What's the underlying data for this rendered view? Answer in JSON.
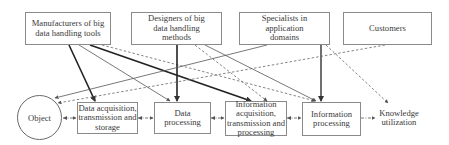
{
  "diagram": {
    "top_nodes": [
      {
        "id": "manufacturers",
        "label": "Manufacturers of big data handling tools"
      },
      {
        "id": "designers",
        "label": "Designers of big data handling methods"
      },
      {
        "id": "specialists",
        "label": "Specialists in application domains"
      },
      {
        "id": "customers",
        "label": "Customers"
      }
    ],
    "flow_nodes": [
      {
        "id": "object",
        "label": "Object",
        "shape": "circle"
      },
      {
        "id": "data_acquisition",
        "label": "Data acquisition, transmission and storage"
      },
      {
        "id": "data_processing",
        "label": "Data processing"
      },
      {
        "id": "info_acquisition",
        "label": "Information acquisition, transmission and processing"
      },
      {
        "id": "info_processing",
        "label": "Information processing"
      },
      {
        "id": "knowledge",
        "label": "Knowledge utilization",
        "shape": "none"
      }
    ],
    "edges": [
      {
        "from": "manufacturers",
        "to": "data_acquisition",
        "style": "thick-solid"
      },
      {
        "from": "manufacturers",
        "to": "data_processing",
        "style": "thin-solid"
      },
      {
        "from": "manufacturers",
        "to": "info_acquisition",
        "style": "thick-solid"
      },
      {
        "from": "manufacturers",
        "to": "info_processing",
        "style": "dashed"
      },
      {
        "from": "designers",
        "to": "data_processing",
        "style": "thick-solid"
      },
      {
        "from": "designers",
        "to": "info_acquisition",
        "style": "dashed"
      },
      {
        "from": "designers",
        "to": "info_processing",
        "style": "thin-solid"
      },
      {
        "from": "specialists",
        "to": "object",
        "style": "thin-solid"
      },
      {
        "from": "specialists",
        "to": "info_processing",
        "style": "thick-solid"
      },
      {
        "from": "specialists",
        "to": "knowledge",
        "style": "dashed"
      },
      {
        "from": "customers",
        "to": "object",
        "style": "dashed"
      },
      {
        "from": "object",
        "to": "data_acquisition",
        "style": "dash-dot"
      },
      {
        "from": "data_acquisition",
        "to": "data_processing",
        "style": "dash-dot"
      },
      {
        "from": "data_processing",
        "to": "info_acquisition",
        "style": "dash-dot"
      },
      {
        "from": "info_acquisition",
        "to": "info_processing",
        "style": "dash-dot"
      },
      {
        "from": "info_processing",
        "to": "knowledge",
        "style": "dash-dot"
      }
    ],
    "colors": {
      "line": "#222222",
      "thin_line": "#555555",
      "dashed": "#666666",
      "border": "#8a8a8a"
    }
  }
}
